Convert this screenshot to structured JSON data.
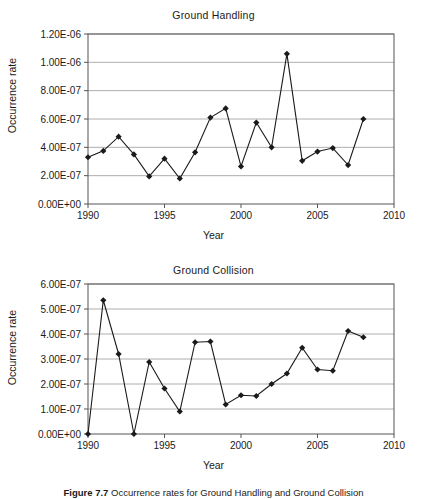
{
  "figure": {
    "caption_label": "Figure 7.7",
    "caption_text": "Occurrence rates for Ground Handling and Ground Collision"
  },
  "chart_data": [
    {
      "type": "line",
      "title": "Ground Handling",
      "xlabel": "Year",
      "ylabel": "Occurrence rate",
      "grid": true,
      "legend": "none",
      "xlim": [
        1990,
        2010
      ],
      "ylim": [
        0,
        1.2e-06
      ],
      "xticks": [
        1990,
        1995,
        2000,
        2005,
        2010
      ],
      "xticklabels": [
        "1990",
        "1995",
        "2000",
        "2005",
        "2010"
      ],
      "yticks": [
        0,
        2e-07,
        4e-07,
        6e-07,
        8e-07,
        1e-06,
        1.2e-06
      ],
      "yticklabels": [
        "0.00E+00",
        "2.00E-07",
        "4.00E-07",
        "6.00E-07",
        "8.00E-07",
        "1.00E-06",
        "1.20E-06"
      ],
      "x": [
        1990,
        1991,
        1992,
        1993,
        1994,
        1995,
        1996,
        1997,
        1998,
        1999,
        2000,
        2001,
        2002,
        2003,
        2004,
        2005,
        2006,
        2007,
        2008
      ],
      "values": [
        3.3e-07,
        3.75e-07,
        4.75e-07,
        3.5e-07,
        1.95e-07,
        3.2e-07,
        1.8e-07,
        3.65e-07,
        6.1e-07,
        6.75e-07,
        2.65e-07,
        5.75e-07,
        4e-07,
        1.06e-06,
        3.05e-07,
        3.7e-07,
        3.95e-07,
        2.75e-07,
        6e-07
      ]
    },
    {
      "type": "line",
      "title": "Ground Collision",
      "xlabel": "Year",
      "ylabel": "Occurrence rate",
      "grid": true,
      "legend": "none",
      "xlim": [
        1990,
        2010
      ],
      "ylim": [
        0,
        6e-07
      ],
      "xticks": [
        1990,
        1995,
        2000,
        2005,
        2010
      ],
      "xticklabels": [
        "1990",
        "1995",
        "2000",
        "2005",
        "2010"
      ],
      "yticks": [
        0,
        1e-07,
        2e-07,
        3e-07,
        4e-07,
        5e-07,
        6e-07
      ],
      "yticklabels": [
        "0.00E+00",
        "1.00E-07",
        "2.00E-07",
        "3.00E-07",
        "4.00E-07",
        "5.00E-07",
        "6.00E-07"
      ],
      "x": [
        1990,
        1991,
        1992,
        1993,
        1994,
        1995,
        1996,
        1997,
        1998,
        1999,
        2000,
        2001,
        2002,
        2003,
        2004,
        2005,
        2006,
        2007,
        2008
      ],
      "values": [
        0,
        5.35e-07,
        3.2e-07,
        0,
        2.88e-07,
        1.82e-07,
        9e-08,
        3.67e-07,
        3.7e-07,
        1.18e-07,
        1.55e-07,
        1.52e-07,
        2e-07,
        2.42e-07,
        3.45e-07,
        2.58e-07,
        2.53e-07,
        4.12e-07,
        3.87e-07
      ]
    }
  ],
  "style": {
    "axis_color": "#555555",
    "grid_color": "#999999",
    "series_color": "#1a1a1a",
    "marker": "diamond"
  }
}
